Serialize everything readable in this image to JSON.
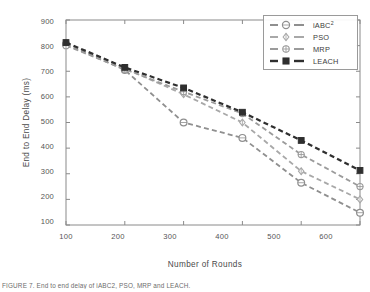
{
  "chart_data": {
    "type": "line",
    "title": "",
    "xlabel": "Number of Rounds",
    "ylabel": "End to End Delay (ms)",
    "x": [
      100,
      200,
      300,
      400,
      500,
      600
    ],
    "xlim": [
      100,
      600
    ],
    "ylim": [
      100,
      900
    ],
    "xticks": [
      "100",
      "200",
      "300",
      "400",
      "500",
      "600"
    ],
    "yticks": [
      "900",
      "800",
      "700",
      "600",
      "500",
      "400",
      "300",
      "200",
      "100"
    ],
    "grid": false,
    "legend_position": "top-right",
    "series": [
      {
        "name": "iABC2",
        "label": "iABC",
        "label_sup": "2",
        "marker": "circle-open",
        "color": "#8f8f8f",
        "values": [
          805,
          705,
          500,
          440,
          265,
          148
        ]
      },
      {
        "name": "PSO",
        "label": "PSO",
        "label_sup": "",
        "marker": "diamond-open",
        "color": "#a8a8a8",
        "values": [
          810,
          712,
          610,
          500,
          310,
          200
        ]
      },
      {
        "name": "MRP",
        "label": "MRP",
        "label_sup": "",
        "marker": "circle-cross",
        "color": "#9b9b9b",
        "values": [
          800,
          708,
          620,
          535,
          375,
          250
        ]
      },
      {
        "name": "LEACH",
        "label": "LEACH",
        "label_sup": "",
        "marker": "square-filled",
        "color": "#2f2f2f",
        "values": [
          812,
          715,
          635,
          540,
          430,
          313
        ]
      }
    ]
  },
  "caption": "FIGURE 7. End to end delay of iABC2, PSO, MRP and LEACH."
}
